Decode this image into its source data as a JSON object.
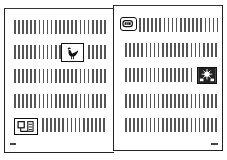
{
  "spread": {
    "type": "open-book-sketch",
    "left_page": {
      "text_rows": 5,
      "figures": [
        {
          "name": "bird-icon",
          "row": 2
        },
        {
          "name": "phone-box-icon",
          "row": 5
        }
      ],
      "page_marker_position": "bottom-left"
    },
    "right_page": {
      "text_rows": 5,
      "figures": [
        {
          "name": "mouth-sign-icon",
          "row": 1
        },
        {
          "name": "sunburst-tile-icon",
          "row": 3
        }
      ],
      "page_marker_position": "bottom-right"
    }
  },
  "colors": {
    "ink": "#222222",
    "text_lines": "#555555",
    "paper": "#ffffff"
  }
}
